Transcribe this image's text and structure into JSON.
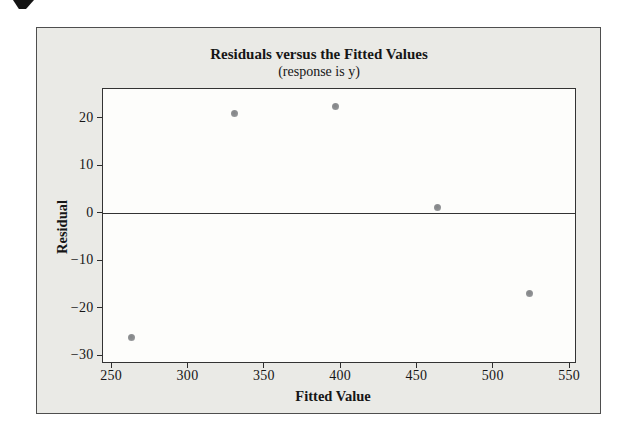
{
  "decorations": {
    "corner_mark": "page-corner-scan-artifact"
  },
  "chart_data": {
    "type": "scatter",
    "title": "Residuals versus the Fitted Values",
    "subtitle": "(response is y)",
    "xlabel": "Fitted Value",
    "ylabel": "Residual",
    "xlim": [
      244.3,
      554.2
    ],
    "ylim": [
      -31.5,
      26.2
    ],
    "x_ticks": [
      250,
      300,
      350,
      400,
      450,
      500,
      550
    ],
    "x_tick_labels": [
      "250",
      "300",
      "350",
      "400",
      "450",
      "500",
      "550"
    ],
    "y_ticks": [
      20,
      10,
      0,
      -10,
      -20,
      -30
    ],
    "y_tick_labels": [
      "20",
      "10",
      "0",
      "−10",
      "−20",
      "−30"
    ],
    "reference_line_y": 0,
    "grid": false,
    "legend": null,
    "points": [
      {
        "x": 263,
        "y": -26.3
      },
      {
        "x": 331,
        "y": 20.9
      },
      {
        "x": 397,
        "y": 22.4
      },
      {
        "x": 464,
        "y": 1.2
      },
      {
        "x": 524,
        "y": -17.0
      }
    ],
    "colors": {
      "point": "#8f9193",
      "panel_bg": "#eaeae6",
      "plot_bg": "#fdfdfb",
      "axis": "#333333",
      "panel_border": "#4e4e4e",
      "text": "#161616"
    }
  }
}
